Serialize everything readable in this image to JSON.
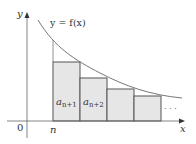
{
  "diagram": {
    "curve_label": "y = f(x)",
    "y_axis_label": "y",
    "x_axis_label": "x",
    "origin_label": "0",
    "n_label": "n",
    "ellipsis": "· · ·",
    "rect_labels": [
      {
        "base": "a",
        "sub": "n+1"
      },
      {
        "base": "a",
        "sub": "n+2"
      }
    ],
    "colors": {
      "background": "#ffffff",
      "rect_fill": "#e6e6e6",
      "rect_stroke": "#555555",
      "curve": "#777777",
      "axis": "#666666",
      "text": "#333333"
    },
    "rectangles": [
      {
        "x0": 53,
        "x1": 80,
        "top": 62
      },
      {
        "x0": 80,
        "x1": 107,
        "top": 78
      },
      {
        "x0": 107,
        "x1": 134,
        "top": 89
      },
      {
        "x0": 134,
        "x1": 161,
        "top": 96
      }
    ]
  }
}
